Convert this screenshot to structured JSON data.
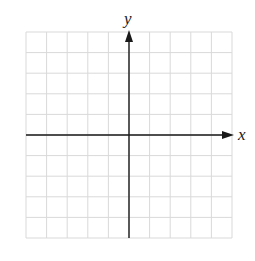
{
  "diagram": {
    "type": "coordinate-plane",
    "grid": {
      "columns": 10,
      "rows": 10,
      "left": 26,
      "top": 32,
      "cell": 20.6,
      "line_color": "#d9d9d9"
    },
    "axes": {
      "color": "#1a1a1a",
      "origin_col": 5,
      "origin_row": 5,
      "x_label": "x",
      "y_label": "y",
      "arrows": [
        "positive-x",
        "positive-y"
      ]
    }
  }
}
